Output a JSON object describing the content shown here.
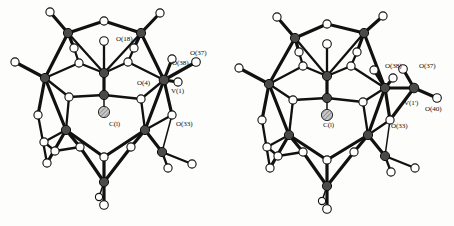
{
  "figure": {
    "kind": "crystal-structure-ortep-pair",
    "background_color": "#fdfdfb",
    "width": 454,
    "height": 226,
    "atom_colors": {
      "vanadium": "#4a4a4a",
      "oxygen": "#ffffff",
      "carbon_central": "#9e9e9e",
      "bond": "#111111"
    }
  },
  "panels": [
    {
      "id": "left",
      "name": "left-structure",
      "labels": [
        {
          "id": "o18",
          "text": "O(18)",
          "x": 116,
          "y": 41
        },
        {
          "id": "o37",
          "text": "O(37)",
          "x": 190,
          "y": 55
        },
        {
          "id": "o38",
          "text": "O(38)",
          "x": 172,
          "y": 65
        },
        {
          "id": "o4",
          "text": "O(4)",
          "x": 137,
          "y": 85
        },
        {
          "id": "v1",
          "text": "V(1)",
          "x": 171,
          "y": 93
        },
        {
          "id": "c1",
          "text": "C(l)",
          "x": 109,
          "y": 126
        },
        {
          "id": "o33",
          "text": "O(33)",
          "x": 176,
          "y": 126
        }
      ]
    },
    {
      "id": "right",
      "name": "right-structure",
      "labels": [
        {
          "id": "o38r",
          "text": "O(38)",
          "x": 385,
          "y": 68
        },
        {
          "id": "o37r",
          "text": "O(37)",
          "x": 419,
          "y": 68
        },
        {
          "id": "v1pr",
          "text": "V(1')",
          "x": 404,
          "y": 105
        },
        {
          "id": "o40r",
          "text": "O(40)",
          "x": 425,
          "y": 111
        },
        {
          "id": "c1r",
          "text": "C(l)",
          "x": 323,
          "y": 127
        },
        {
          "id": "o33r",
          "text": "O(33)",
          "x": 391,
          "y": 128
        }
      ]
    }
  ],
  "geometry": {
    "vanadium_radius": 4.6,
    "oxygen_radius": 4.1,
    "carbon_radius": 5.6,
    "vanadium_sites": [
      [
        68,
        33
      ],
      [
        141,
        33
      ],
      [
        45,
        78
      ],
      [
        104,
        73
      ],
      [
        104,
        95
      ],
      [
        164,
        80
      ],
      [
        66,
        130
      ],
      [
        145,
        130
      ],
      [
        162,
        152
      ],
      [
        104,
        182
      ]
    ],
    "oxygen_sites": [
      [
        50,
        12
      ],
      [
        104,
        21
      ],
      [
        160,
        13
      ],
      [
        15,
        62
      ],
      [
        74,
        48
      ],
      [
        134,
        48
      ],
      [
        38,
        115
      ],
      [
        104,
        41
      ],
      [
        128,
        62
      ],
      [
        79,
        63
      ],
      [
        141,
        99
      ],
      [
        69,
        97
      ],
      [
        104,
        112
      ],
      [
        172,
        59
      ],
      [
        196,
        62
      ],
      [
        178,
        82
      ],
      [
        172,
        115
      ],
      [
        47,
        163
      ],
      [
        80,
        147
      ],
      [
        131,
        147
      ],
      [
        168,
        168
      ],
      [
        192,
        164
      ],
      [
        104,
        157
      ],
      [
        104,
        205
      ],
      [
        99,
        197
      ],
      [
        44,
        142
      ],
      [
        55,
        151
      ]
    ],
    "carbon_site": [
      104,
      112
    ]
  }
}
